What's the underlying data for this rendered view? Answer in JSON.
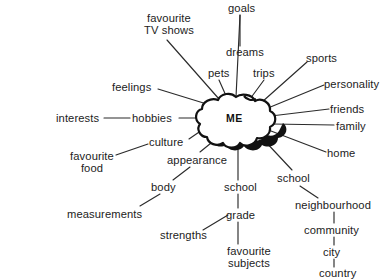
{
  "diagram": {
    "title": "ME mind map",
    "type": "mind-map",
    "background_color": "#ffffff",
    "line_color": "#2b2b2b",
    "text_color": "#222222",
    "center": {
      "label": "ME",
      "shape": "cloud"
    },
    "nodes": [
      {
        "id": "goals",
        "label": "goals",
        "x": 228,
        "y": 2,
        "parent": "center"
      },
      {
        "id": "dreams",
        "label": "dreams",
        "x": 226,
        "y": 46,
        "parent": "goals"
      },
      {
        "id": "favourite-tv-shows",
        "label": "favourite\nTV shows",
        "x": 126,
        "y": 12,
        "parent": "center"
      },
      {
        "id": "pets",
        "label": "pets",
        "x": 208,
        "y": 67,
        "parent": "center"
      },
      {
        "id": "trips",
        "label": "trips",
        "x": 253,
        "y": 67,
        "parent": "center"
      },
      {
        "id": "sports",
        "label": "sports",
        "x": 306,
        "y": 52,
        "parent": "center"
      },
      {
        "id": "personality",
        "label": "personality",
        "x": 324,
        "y": 78,
        "parent": "center"
      },
      {
        "id": "feelings",
        "label": "feelings",
        "x": 112,
        "y": 81,
        "parent": "center"
      },
      {
        "id": "friends",
        "label": "friends",
        "x": 330,
        "y": 103,
        "parent": "center"
      },
      {
        "id": "family",
        "label": "family",
        "x": 336,
        "y": 120,
        "parent": "center"
      },
      {
        "id": "interests",
        "label": "interests",
        "x": 56,
        "y": 112,
        "parent": "hobbies"
      },
      {
        "id": "hobbies",
        "label": "hobbies",
        "x": 132,
        "y": 112,
        "parent": "center"
      },
      {
        "id": "home",
        "label": "home",
        "x": 327,
        "y": 147,
        "parent": "center"
      },
      {
        "id": "culture",
        "label": "culture",
        "x": 149,
        "y": 136,
        "parent": "center"
      },
      {
        "id": "favourite-food",
        "label": "favourite\nfood",
        "x": 64,
        "y": 150,
        "parent": "culture"
      },
      {
        "id": "appearance",
        "label": "appearance",
        "x": 167,
        "y": 154,
        "parent": "center"
      },
      {
        "id": "body",
        "label": "body",
        "x": 151,
        "y": 181,
        "parent": "appearance"
      },
      {
        "id": "school-center",
        "label": "school",
        "x": 224,
        "y": 181,
        "parent": "center"
      },
      {
        "id": "school-right",
        "label": "school",
        "x": 277,
        "y": 172,
        "parent": "center"
      },
      {
        "id": "measurements",
        "label": "measurements",
        "x": 67,
        "y": 208,
        "parent": "body"
      },
      {
        "id": "grade",
        "label": "grade",
        "x": 226,
        "y": 209,
        "parent": "school-center"
      },
      {
        "id": "neighbourhood",
        "label": "neighbourhood",
        "x": 295,
        "y": 199,
        "parent": "school-right"
      },
      {
        "id": "community",
        "label": "community",
        "x": 304,
        "y": 224,
        "parent": "neighbourhood"
      },
      {
        "id": "strengths",
        "label": "strengths",
        "x": 160,
        "y": 229,
        "parent": "grade"
      },
      {
        "id": "city",
        "label": "city",
        "x": 323,
        "y": 246,
        "parent": "community"
      },
      {
        "id": "favourite-subjects",
        "label": "favourite\nsubjects",
        "x": 218,
        "y": 245,
        "parent": "grade"
      },
      {
        "id": "country",
        "label": "country",
        "x": 319,
        "y": 267,
        "parent": "city"
      }
    ]
  }
}
